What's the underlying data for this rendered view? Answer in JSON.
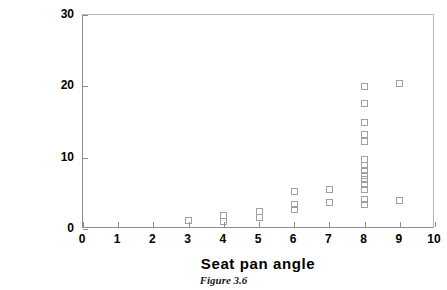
{
  "chart_data": {
    "type": "scatter",
    "title": "",
    "caption": "Figure 3.6",
    "xlabel": "Seat pan angle",
    "ylabel": "Back rest angle",
    "xlim": [
      0,
      10
    ],
    "ylim": [
      0,
      30
    ],
    "xticks": [
      0,
      1,
      2,
      3,
      4,
      5,
      6,
      7,
      8,
      9,
      10
    ],
    "xtick_labels": [
      "0",
      "1",
      "2",
      "3",
      "4",
      "5",
      "6",
      "7",
      "8",
      "9",
      "10"
    ],
    "yticks": [
      0,
      10,
      20,
      30
    ],
    "ytick_labels": [
      "0",
      "10",
      "20",
      "30"
    ],
    "grid": false,
    "legend": null,
    "marker": {
      "shape": "open-square",
      "size_px": 7,
      "edge_color": "#a0a0a0",
      "fill_color": "none"
    },
    "series": [
      {
        "name": "observations",
        "points": [
          [
            3,
            1.2
          ],
          [
            4,
            1.9
          ],
          [
            4,
            1.1
          ],
          [
            5,
            2.4
          ],
          [
            5,
            1.6
          ],
          [
            6,
            5.2
          ],
          [
            6,
            3.4
          ],
          [
            6,
            2.8
          ],
          [
            7,
            5.5
          ],
          [
            7,
            3.7
          ],
          [
            8,
            20.0
          ],
          [
            8,
            17.6
          ],
          [
            8,
            15.0
          ],
          [
            8,
            13.2
          ],
          [
            8,
            12.2
          ],
          [
            8,
            9.7
          ],
          [
            8,
            8.9
          ],
          [
            8,
            8.2
          ],
          [
            8,
            7.5
          ],
          [
            8,
            6.9
          ],
          [
            8,
            6.2
          ],
          [
            8,
            5.5
          ],
          [
            8,
            4.2
          ],
          [
            8,
            3.4
          ],
          [
            9,
            20.4
          ],
          [
            9,
            4.0
          ]
        ]
      }
    ]
  },
  "axis_colors": {
    "axis_line": "#8d8d8d",
    "frame_line": "#b9b9b9",
    "text": "#000000"
  }
}
